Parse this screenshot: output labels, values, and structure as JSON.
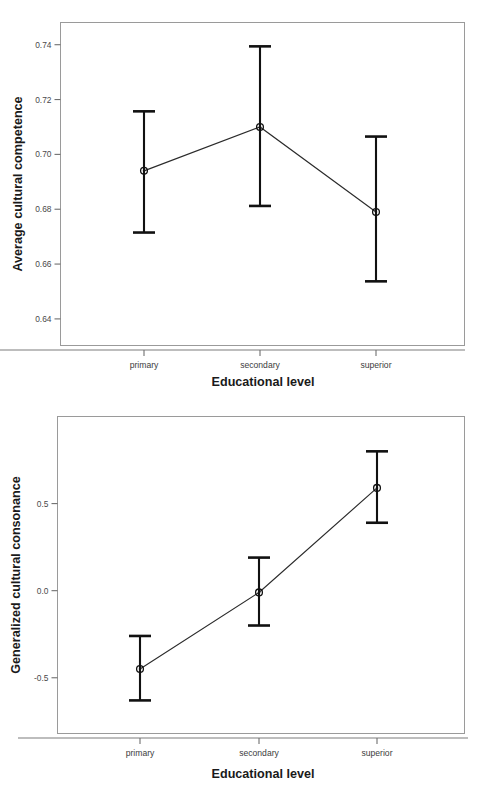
{
  "figure": {
    "background_color": "#ffffff",
    "ink_color": "#111111",
    "frame_color": "#9a9a9a"
  },
  "chart_data": [
    {
      "id": "top",
      "type": "line",
      "title": "",
      "subtitle": "",
      "xlabel": "Educational level",
      "ylabel": "Average cultural competence",
      "categories": [
        "primary",
        "secondary",
        "superior"
      ],
      "values": [
        0.694,
        0.71,
        0.679
      ],
      "error_low": [
        0.6715,
        0.6812,
        0.6537
      ],
      "error_high": [
        0.7157,
        0.7394,
        0.7065
      ],
      "ytick_labels": [
        "0.74",
        "0.72",
        "0.70",
        "0.68",
        "0.66",
        "0.64"
      ],
      "ytick_values": [
        0.74,
        0.72,
        0.7,
        0.68,
        0.66,
        0.64
      ],
      "ylim": [
        0.6303,
        0.7481
      ],
      "grid": false,
      "legend": "none",
      "error_bar_type": "95% CI"
    },
    {
      "id": "bottom",
      "type": "line",
      "title": "",
      "subtitle": "",
      "xlabel": "Educational level",
      "ylabel": "Generalized cultural consonance",
      "categories": [
        "primary",
        "secondary",
        "superior"
      ],
      "values": [
        -0.45,
        -0.01,
        0.59
      ],
      "error_low": [
        -0.63,
        -0.2,
        0.39
      ],
      "error_high": [
        -0.26,
        0.19,
        0.8
      ],
      "ytick_labels": [
        "0.5",
        "0.0",
        "-0.5"
      ],
      "ytick_values": [
        0.5,
        0.0,
        -0.5
      ],
      "ylim": [
        -0.82,
        1.0
      ],
      "grid": false,
      "legend": "none",
      "error_bar_type": "95% CI"
    }
  ]
}
